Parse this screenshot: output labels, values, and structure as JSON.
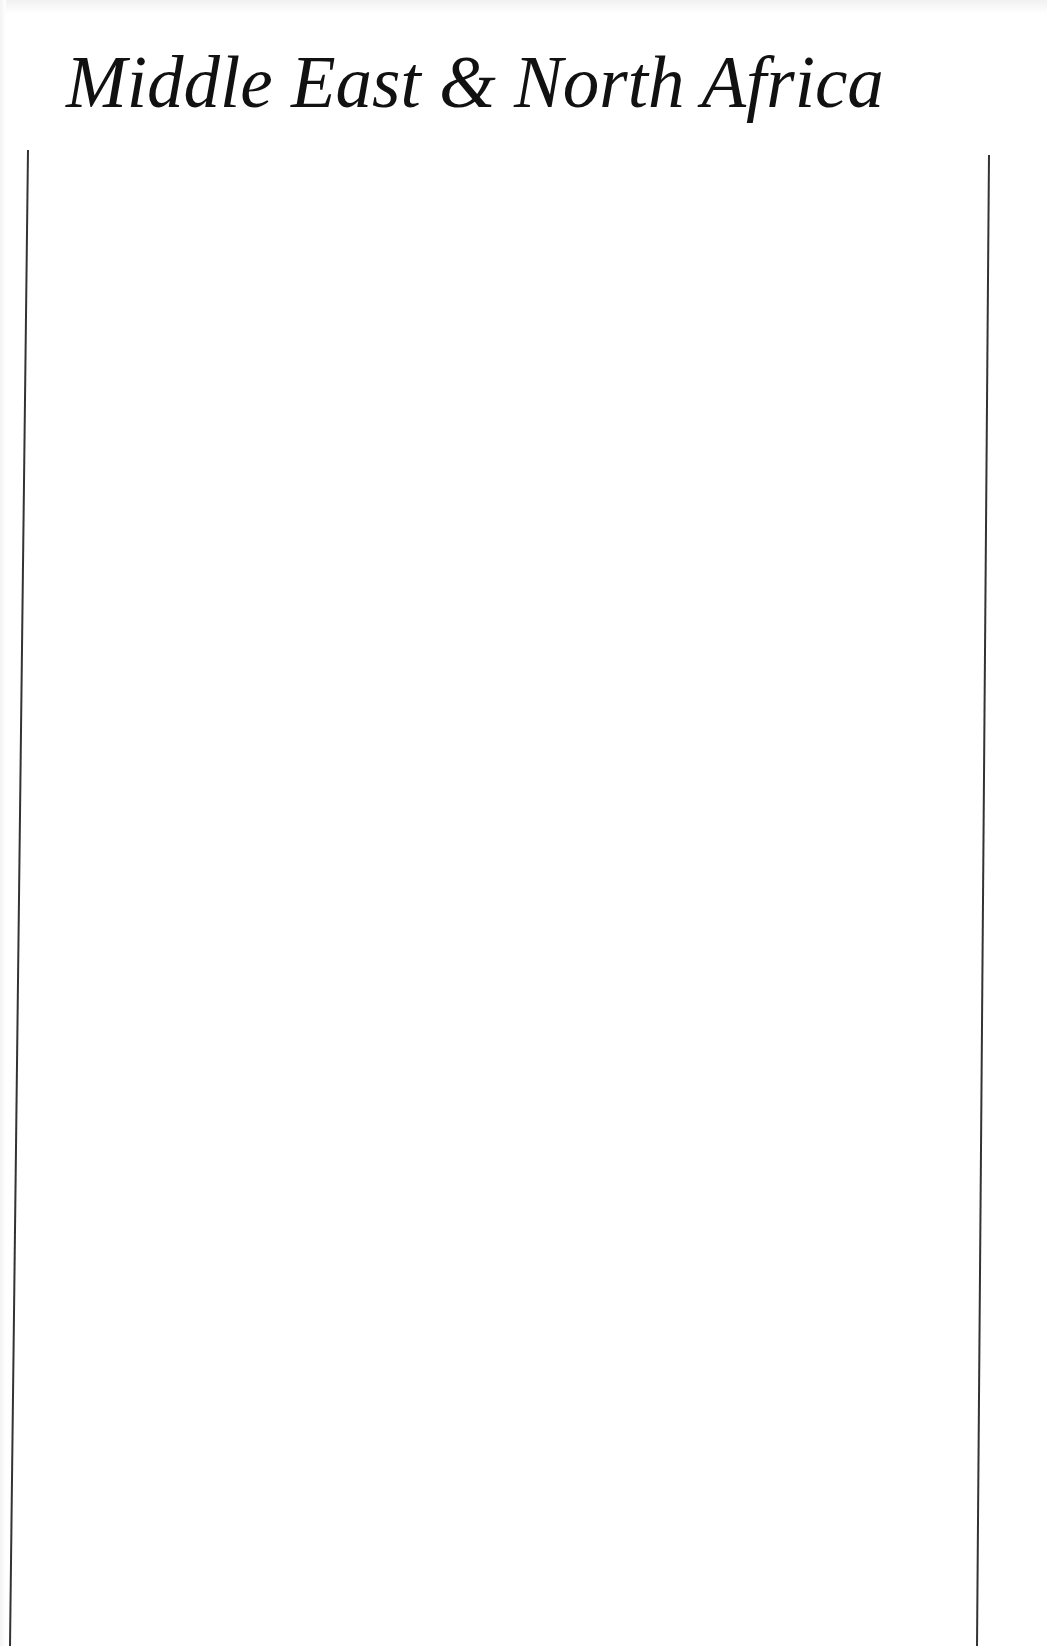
{
  "page": {
    "title": "Middle East & North Africa",
    "background": "#ffffff",
    "text_color": "#111111",
    "rule_color": "#333333"
  },
  "rules": {
    "left": {
      "x1": 28,
      "y1": 150,
      "x2": 10,
      "y2": 1646
    },
    "right": {
      "x1": 989,
      "y1": 155,
      "x2": 977,
      "y2": 1646
    }
  }
}
